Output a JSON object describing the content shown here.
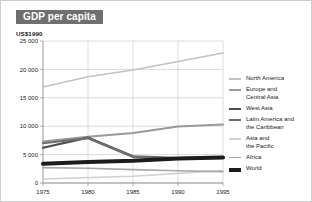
{
  "figure": {
    "title": "GDP per capita",
    "unit_label": "US$1990",
    "background_color": "#ffffff",
    "title_band_color": "#6f6f6f",
    "title_text_color": "#ffffff",
    "border_color": "#cfcfcf"
  },
  "axes": {
    "y_ticks": [
      "0",
      "5 000",
      "10 000",
      "15 000",
      "20 000",
      "25 000"
    ],
    "x_ticks": [
      "1975",
      "1980",
      "1985",
      "1990",
      "1995"
    ],
    "axis_color": "#8c8c8c",
    "grid_color": "#b9b9b9"
  },
  "legend": {
    "position": "right",
    "items": [
      {
        "label": "North America",
        "color": "#c2c2c2",
        "width": 1.6
      },
      {
        "label": "Europe and\nCentral Asia",
        "color": "#9a9a9a",
        "width": 2.0
      },
      {
        "label": "West Asia",
        "color": "#4e4e4e",
        "width": 2.2
      },
      {
        "label": "Latin America and\nthe Caribbean",
        "color": "#6e6e6e",
        "width": 2.2
      },
      {
        "label": "Asia and\nthe Pacific",
        "color": "#d2d2d2",
        "width": 1.6
      },
      {
        "label": "Africa",
        "color": "#a8a8a8",
        "width": 1.6
      },
      {
        "label": "World",
        "color": "#1c1c1c",
        "width": 4.0
      }
    ]
  },
  "chart_data": {
    "type": "line",
    "title": "GDP per capita",
    "xlabel": "",
    "ylabel": "US$1990",
    "x": [
      1975,
      1980,
      1985,
      1990,
      1995
    ],
    "xlim": [
      1975,
      1995
    ],
    "ylim": [
      0,
      25000
    ],
    "grid": true,
    "legend_position": "right",
    "series": [
      {
        "name": "North America",
        "color": "#c2c2c2",
        "values": [
          16900,
          18700,
          19900,
          21400,
          22900
        ]
      },
      {
        "name": "Europe and Central Asia",
        "color": "#9a9a9a",
        "values": [
          7300,
          8150,
          8800,
          9950,
          10300
        ]
      },
      {
        "name": "West Asia",
        "color": "#4e4e4e",
        "values": [
          6200,
          8000,
          4700,
          4400,
          4500
        ]
      },
      {
        "name": "Latin America and the Caribbean",
        "color": "#6e6e6e",
        "values": [
          7000,
          7900,
          4600,
          4300,
          4400
        ]
      },
      {
        "name": "Asia and the Pacific",
        "color": "#d2d2d2",
        "values": [
          700,
          950,
          1200,
          1700,
          2200
        ]
      },
      {
        "name": "Africa",
        "color": "#a8a8a8",
        "values": [
          2700,
          2600,
          2350,
          2150,
          2000
        ]
      },
      {
        "name": "World",
        "color": "#1c1c1c",
        "values": [
          3400,
          3700,
          3900,
          4300,
          4500
        ]
      }
    ]
  }
}
